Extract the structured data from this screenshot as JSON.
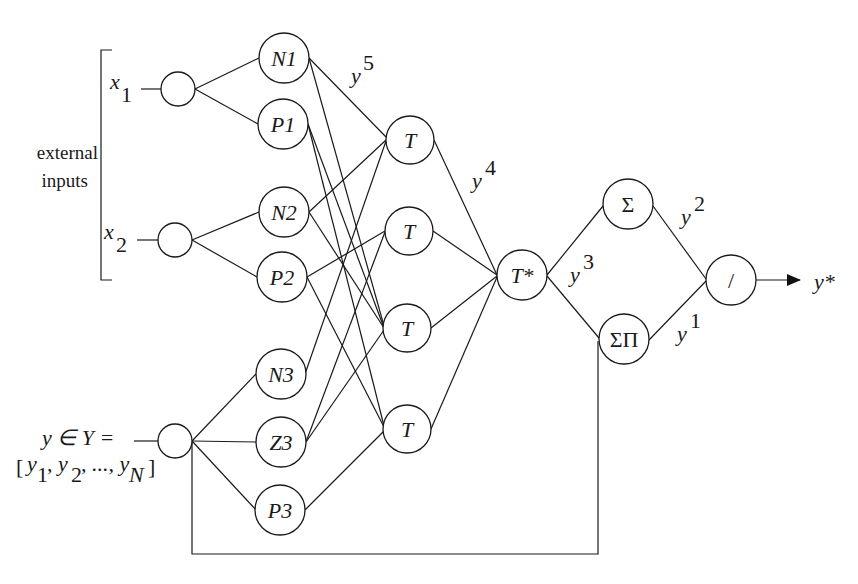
{
  "left_labels": {
    "external_line1": "external",
    "external_line2": "inputs",
    "x1_base": "x",
    "x1_sub": "1",
    "x2_base": "x",
    "x2_sub": "2",
    "y_set": "y ∈ Y =",
    "y_vec_open": "[",
    "y_vec_y1": "y",
    "y_vec_s1": "1",
    "y_vec_y2": ", y",
    "y_vec_s2": "2",
    "y_vec_dots": ", ..., y",
    "y_vec_sN": "N",
    "y_vec_close": "]"
  },
  "nodes": {
    "in1": "",
    "in2": "",
    "in3": "",
    "n1": "N1",
    "p1": "P1",
    "n2": "N2",
    "p2": "P2",
    "n3": "N3",
    "z3": "Z3",
    "p3": "P3",
    "t1": "T",
    "t2": "T",
    "t3": "T",
    "t4": "T",
    "tstar": "T*",
    "sigma": "Σ",
    "sigmapi": "ΣΠ",
    "divide": "/"
  },
  "signal_labels": {
    "y5": "y",
    "y5_sup": "5",
    "y4": "y",
    "y4_sup": "4",
    "y3": "y",
    "y3_sup": "3",
    "y2": "y",
    "y2_sup": "2",
    "y1": "y",
    "y1_sup": "1",
    "output": "y*"
  },
  "edges": [
    [
      "n1",
      "t1"
    ],
    [
      "n1",
      "t3"
    ],
    [
      "p1",
      "t3"
    ],
    [
      "p1",
      "t4"
    ],
    [
      "n2",
      "t1"
    ],
    [
      "n2",
      "t3"
    ],
    [
      "p2",
      "t2"
    ],
    [
      "p2",
      "t4"
    ],
    [
      "n3",
      "t1"
    ],
    [
      "z3",
      "t2"
    ],
    [
      "z3",
      "t3"
    ],
    [
      "p3",
      "t4"
    ],
    [
      "t1",
      "tstar"
    ],
    [
      "t2",
      "tstar"
    ],
    [
      "t3",
      "tstar"
    ],
    [
      "t4",
      "tstar"
    ],
    [
      "tstar",
      "sigma"
    ],
    [
      "tstar",
      "sigmapi"
    ],
    [
      "sigma",
      "divide"
    ],
    [
      "sigmapi",
      "divide"
    ]
  ]
}
